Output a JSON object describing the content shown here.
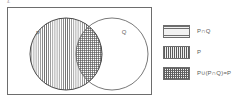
{
  "figure": {
    "corner_mark": "4.",
    "universe": {
      "name": "universal-set-rectangle"
    },
    "sets": [
      {
        "id": "P",
        "label": "P",
        "fill": "vertical-hatch"
      },
      {
        "id": "Q",
        "label": "Q",
        "fill": "none"
      }
    ],
    "regions": [
      {
        "id": "p-only",
        "fill": "vertical-hatch"
      },
      {
        "id": "p-intersect-q",
        "fill": "cross-hatch"
      },
      {
        "id": "q-only",
        "fill": "none"
      }
    ]
  },
  "legend": {
    "items": [
      {
        "label": "P∩Q",
        "swatch": "horizontal-hatch"
      },
      {
        "label": "P",
        "swatch": "vertical-hatch"
      },
      {
        "label": "P∪(P∩Q)=P",
        "swatch": "cross-hatch"
      }
    ]
  },
  "colors": {
    "stroke": "#5a5a5a",
    "frame": "#6d6d6d",
    "hatch_light": "#6f6f6f",
    "hatch_dark": "#4e4e4e",
    "background": "#ffffff",
    "swatch_fill": "#f2f2f2"
  }
}
